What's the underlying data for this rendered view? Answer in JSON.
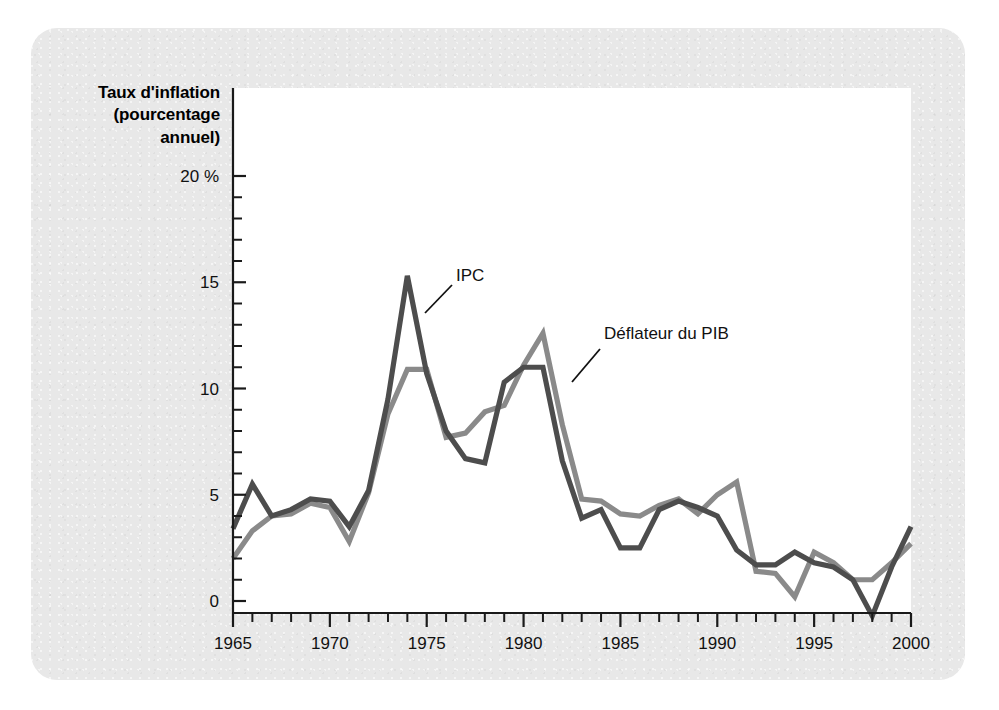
{
  "figure": {
    "background_color": "#ffffff",
    "panel_color": "#e8e8e8",
    "plot_color": "#ffffff"
  },
  "axis_title": {
    "line1": "Taux d'inflation",
    "line2": "(pourcentage",
    "line3": "annuel)"
  },
  "annotations": {
    "cpi_label": "IPC",
    "deflator_label": "Déflateur du PIB"
  },
  "chart_data": {
    "type": "line",
    "title": "Taux d'inflation (pourcentage annuel)",
    "xlabel": "",
    "ylabel": "Taux d'inflation (pourcentage annuel)",
    "xlim": [
      1965,
      2000
    ],
    "ylim": [
      -2,
      20
    ],
    "grid": false,
    "legend_position": "inline-annotation",
    "y_tick_labels": [
      "20 %",
      "15",
      "10",
      "5",
      "0"
    ],
    "y_tick_values": [
      20,
      15,
      10,
      5,
      0
    ],
    "y_minor_tick_step": 1,
    "x_tick_labels": [
      "1965",
      "1970",
      "1975",
      "1980",
      "1985",
      "1990",
      "1995",
      "2000"
    ],
    "x_tick_values": [
      1965,
      1970,
      1975,
      1980,
      1985,
      1990,
      1995,
      2000
    ],
    "x_minor_tick_step": 1,
    "x": [
      1965,
      1966,
      1967,
      1968,
      1969,
      1970,
      1971,
      1972,
      1973,
      1974,
      1975,
      1976,
      1977,
      1978,
      1979,
      1980,
      1981,
      1982,
      1983,
      1984,
      1985,
      1986,
      1987,
      1988,
      1989,
      1990,
      1991,
      1992,
      1993,
      1994,
      1995,
      1996,
      1997,
      1998,
      1999,
      2000
    ],
    "series": [
      {
        "name": "IPC",
        "color": "#4d4d4d",
        "values": [
          3.4,
          5.5,
          4.0,
          4.3,
          4.8,
          4.7,
          3.5,
          5.2,
          9.5,
          15.3,
          10.7,
          8.0,
          6.7,
          6.5,
          10.3,
          11.0,
          11.0,
          6.6,
          3.9,
          4.3,
          2.5,
          2.5,
          4.3,
          4.7,
          4.4,
          4.0,
          2.4,
          1.7,
          1.7,
          2.3,
          1.8,
          1.6,
          1.0,
          -0.7,
          1.6,
          3.5
        ]
      },
      {
        "name": "Déflateur du PIB",
        "color": "#8a8a8a",
        "values": [
          2.0,
          3.3,
          4.0,
          4.1,
          4.6,
          4.4,
          2.8,
          5.1,
          8.8,
          10.9,
          10.9,
          7.7,
          7.9,
          8.9,
          9.2,
          11.1,
          12.6,
          8.3,
          4.8,
          4.7,
          4.1,
          4.0,
          4.5,
          4.8,
          4.1,
          5.0,
          5.6,
          1.4,
          1.3,
          0.2,
          2.3,
          1.8,
          1.0,
          1.0,
          1.8,
          2.7
        ]
      }
    ]
  }
}
